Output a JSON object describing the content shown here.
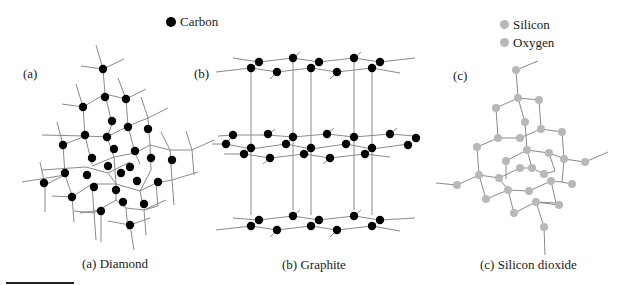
{
  "legend": {
    "carbon": {
      "label": "Carbon",
      "color": "#000000"
    },
    "silicon": {
      "label": "Silicon",
      "color": "#b8b8b8"
    },
    "oxygen": {
      "label": "Oxygen",
      "color": "#b8b8b8"
    }
  },
  "panels": [
    {
      "tag": "(a)",
      "caption": "(a) Diamond",
      "atom": "carbon"
    },
    {
      "tag": "(b)",
      "caption": "(b) Graphite",
      "atom": "carbon"
    },
    {
      "tag": "(c)",
      "caption": "(c) Silicon dioxide",
      "atom": "silicon/oxygen"
    }
  ],
  "colors": {
    "bond": "#8a8a8a",
    "carbon": "#000000",
    "silica": "#b8b8b8"
  }
}
